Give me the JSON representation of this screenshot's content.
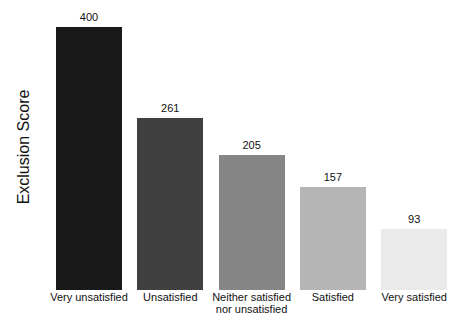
{
  "background": "#ffffff",
  "text_color": "#111111",
  "chart_data": {
    "type": "bar",
    "title": "",
    "xlabel": "",
    "ylabel": "Exclusion Score",
    "categories": [
      "Very unsatisfied",
      "Unsatisfied",
      "Neither satisfied\nnor unsatisfied",
      "Satisfied",
      "Very satisfied"
    ],
    "values": [
      400,
      261,
      205,
      157,
      93
    ],
    "value_labels": [
      "400",
      "261",
      "205",
      "157",
      "93"
    ],
    "bar_colors": [
      "#191919",
      "#404040",
      "#868686",
      "#b5b5b5",
      "#eaeaea"
    ],
    "ylim": [
      0,
      440
    ],
    "grid": false,
    "axis_ticks": "none",
    "legend": "none",
    "value_labels_position": "above-bars"
  }
}
